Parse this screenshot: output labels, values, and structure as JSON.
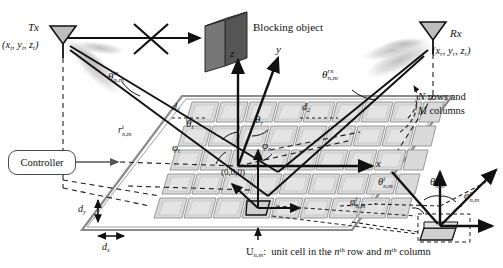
{
  "figure": {
    "type": "ris-system-model-diagram",
    "title_caption": "U",
    "caption_sub": "n,m",
    "caption_rest": ":  unit cell in the n",
    "caption_sup": "th",
    "caption_rest2": " row and m",
    "caption_sup2": "th",
    "caption_rest3": " column"
  },
  "nodes": {
    "tx_label": "Tx",
    "tx_coords_open": "(x",
    "tx_coords": "(xt, yt, zt)",
    "rx_label": "Rx",
    "rx_coords": "(xr, yr, zr)",
    "blocking_object": "Blocking object",
    "controller": "Controller",
    "origin": "(0,0,0)"
  },
  "axes": {
    "x": "x",
    "y": "y",
    "z": "z"
  },
  "angles": {
    "theta_tx": "θ",
    "theta_tx_sup": "tx",
    "theta_tx_sub": "n,m",
    "theta_rx": "θ",
    "theta_rx_sup": "rx",
    "theta_rx_sub": "n,m",
    "theta_t": "θ",
    "theta_t_sub": "t",
    "theta_r": "θ",
    "theta_r_sub": "r",
    "phi_t": "φ",
    "phi_t_sub": "t",
    "phi_r": "φ",
    "phi_r_sub": "r",
    "theta_i_nm": "θ",
    "theta_i_sup": "i",
    "theta_i_sub": "n,m",
    "theta_r_nm": "θ",
    "theta_r_sup": "r",
    "theta_r_nm_sub": "n,m",
    "phi_i_nm": "φ",
    "phi_i_sup": "i",
    "phi_i_sub": "n,m",
    "phi_r_nm": "φ",
    "phi_r_sup": "r",
    "phi_r_nm_sub": "n,m"
  },
  "distances": {
    "r_tx": "r",
    "r_tx_sup": "t",
    "r_tx_sub": "n,m",
    "d1": "d",
    "d1_sub": "1",
    "d2": "d",
    "d2_sub": "2",
    "dy": "d",
    "dy_sub": "y",
    "dx": "d",
    "dx_sub": "x"
  },
  "annotations": {
    "rows_cols_line1": "N rows and",
    "rows_cols_line2": "M columns"
  },
  "colors": {
    "ink": "#111111",
    "cell_fill": "#d6d6d6",
    "cell_edge": "#9a9a9a",
    "panel_frame": "#8a8a8a",
    "block_face": "#6a6a6a",
    "block_side": "#4d4d4d",
    "beam": "#b8b8b8",
    "dash": "#2b2b2b"
  }
}
